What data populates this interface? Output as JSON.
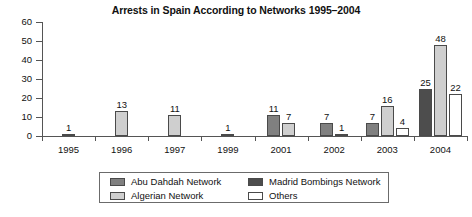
{
  "chart_data": {
    "type": "bar",
    "title": "Arrests in Spain According to Networks 1995–2004",
    "xlabel": "",
    "ylabel": "",
    "ylim": [
      0,
      60
    ],
    "yticks": [
      0,
      10,
      20,
      30,
      40,
      50,
      60
    ],
    "grid": false,
    "legend_position": "bottom",
    "categories": [
      "1995",
      "1996",
      "1997",
      "1999",
      "2001",
      "2002",
      "2003",
      "2004"
    ],
    "series": [
      {
        "name": "Abu Dahdah Network",
        "color": "#808080",
        "values": [
          null,
          null,
          null,
          null,
          11,
          7,
          7,
          null
        ]
      },
      {
        "name": "Madrid Bombings Network",
        "color": "#4d4d4d",
        "values": [
          null,
          null,
          null,
          null,
          null,
          null,
          null,
          25
        ]
      },
      {
        "name": "Algerian Network",
        "color": "#cfcfcf",
        "values": [
          1,
          13,
          11,
          1,
          7,
          1,
          16,
          48
        ]
      },
      {
        "name": "Others",
        "color": "#ffffff",
        "values": [
          null,
          null,
          null,
          null,
          null,
          null,
          4,
          22
        ]
      }
    ],
    "data_labels": [
      "1",
      "13",
      "11",
      "1",
      "11",
      "7",
      "7",
      "1",
      "7",
      "16",
      "4",
      "25",
      "48",
      "22"
    ]
  },
  "axis": {
    "y_tick_labels": [
      "60",
      "50",
      "40",
      "30",
      "20",
      "10",
      "0"
    ],
    "x_tick_labels": [
      "1995",
      "1996",
      "1997",
      "1999",
      "2001",
      "2002",
      "2003",
      "2004"
    ]
  },
  "legend": {
    "items": [
      {
        "label": "Abu Dahdah Network",
        "color": "#808080"
      },
      {
        "label": "Madrid Bombings Network",
        "color": "#4d4d4d"
      },
      {
        "label": "Algerian Network",
        "color": "#cfcfcf"
      },
      {
        "label": "Others",
        "color": "#ffffff"
      }
    ]
  }
}
